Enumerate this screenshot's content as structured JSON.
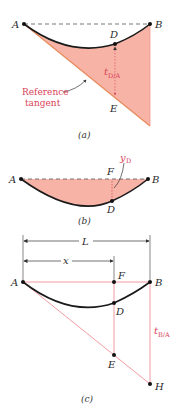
{
  "colors": {
    "fill": "#f7b3a6",
    "accent_red": "#d9435a",
    "tangent_orange": "#e98a5a",
    "curve": "#1a1a1a",
    "line_pink": "#ef8f99"
  },
  "figure_a": {
    "caption": "(a)",
    "points": {
      "A": "A",
      "B": "B",
      "D": "D",
      "E": "E"
    },
    "deviation_label": "t",
    "deviation_subscript": "D/A",
    "annotation_line1": "Reference",
    "annotation_line2": "tangent"
  },
  "figure_b": {
    "caption": "(b)",
    "points": {
      "A": "A",
      "B": "B",
      "F": "F",
      "D": "D"
    },
    "deflection_label": "y",
    "deflection_subscript": "D"
  },
  "figure_c": {
    "caption": "(c)",
    "points": {
      "A": "A",
      "B": "B",
      "F": "F",
      "D": "D",
      "E": "E",
      "H": "H"
    },
    "dim_total": "L",
    "dim_partial": "x",
    "deviation_label": "t",
    "deviation_subscript": "B/A"
  }
}
